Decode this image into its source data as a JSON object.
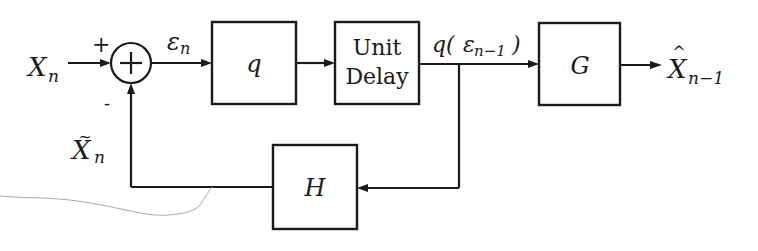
{
  "diagram": {
    "type": "block-diagram",
    "input": {
      "label": "X",
      "subscript": "n"
    },
    "summing_junction": {
      "symbol": "+",
      "plus_sign": "+",
      "minus_sign": "-"
    },
    "error_signal": {
      "label": "ε",
      "subscript": "n"
    },
    "blocks": [
      {
        "id": "quantizer",
        "label": "q"
      },
      {
        "id": "unit-delay",
        "label_line1": "Unit",
        "label_line2": "Delay"
      },
      {
        "id": "G",
        "label": "G"
      },
      {
        "id": "H",
        "label": "H"
      }
    ],
    "delayed_signal": {
      "prefix": "q(",
      "symbol": "ε",
      "subscript": "n−1",
      "suffix": ")"
    },
    "output": {
      "label": "X",
      "accent": "^",
      "subscript": "n−1"
    },
    "feedback": {
      "label": "X",
      "accent": "~",
      "subscript": "n"
    },
    "colors": {
      "ink": "#1a1a1a",
      "background": "#ffffff",
      "smudge": "#a8a8a8"
    }
  }
}
